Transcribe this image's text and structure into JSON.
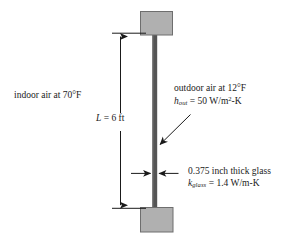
{
  "figure": {
    "colors": {
      "block_fill": "#b0b0b0",
      "block_stroke": "#6e6e6e",
      "pane_fill": "#555555",
      "line": "#1a1a1a",
      "background": "#ffffff"
    }
  },
  "labels": {
    "indoor": {
      "text": "indoor air at 70°F",
      "medium": "indoor air",
      "temperature": "70°F"
    },
    "outdoor": {
      "line1": "outdoor air at 12°F",
      "medium": "outdoor air",
      "temperature": "12°F",
      "coefficient_symbol": "h",
      "coefficient_subscript": "out",
      "coefficient_equals": "=",
      "coefficient_value": "50",
      "coefficient_units_pre": " W/m",
      "coefficient_units_exp": "2",
      "coefficient_units_post": "-K"
    },
    "glass": {
      "line1": "0.375 inch thick glass",
      "thickness_value": "0.375",
      "thickness_unit": "inch",
      "conductivity_symbol": "k",
      "conductivity_subscript": "glass",
      "conductivity_equals": "=",
      "conductivity_value": "1.4",
      "conductivity_units": " W/m-K"
    },
    "length": {
      "symbol": "L",
      "equals": "=",
      "value": "6",
      "unit": "ft",
      "full": "L = 6 ft"
    }
  },
  "parts": {
    "top_block": "top-wall-block",
    "bottom_block": "bottom-wall-block",
    "pane": "glass-pane",
    "length_dimension": "length-dimension-line",
    "thickness_dimension": "thickness-dimension-arrows",
    "leader": "outdoor-leader-arrow"
  }
}
